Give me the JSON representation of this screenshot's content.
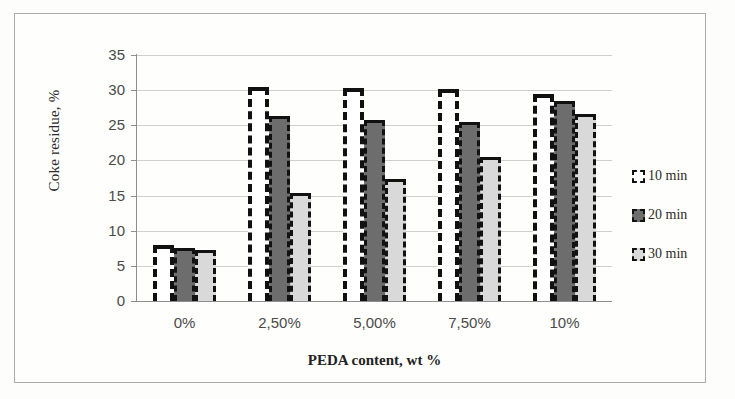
{
  "chart_data": {
    "type": "bar",
    "title": "",
    "xlabel": "PEDA content, wt %",
    "ylabel": "Coke residue, %",
    "categories": [
      "0%",
      "2,50%",
      "5,00%",
      "7,50%",
      "10%"
    ],
    "series": [
      {
        "name": "10 min",
        "values": [
          8.0,
          30.5,
          30.3,
          30.1,
          29.5
        ],
        "color": "#ffffff"
      },
      {
        "name": "20 min",
        "values": [
          7.5,
          26.3,
          25.7,
          25.4,
          28.4
        ],
        "color": "#6d6d6d"
      },
      {
        "name": "30 min",
        "values": [
          7.2,
          15.3,
          17.3,
          20.5,
          26.6
        ],
        "color": "#d9d9d9"
      }
    ],
    "ylim": [
      0,
      35
    ],
    "ytick_values": [
      0,
      5,
      10,
      15,
      20,
      25,
      30,
      35
    ],
    "ytick_labels": [
      "0",
      "5",
      "10",
      "15",
      "20",
      "25",
      "30",
      "35"
    ],
    "grid": true,
    "legend_position": "right"
  },
  "legend": {
    "items": [
      {
        "label": "10 min"
      },
      {
        "label": "20 min"
      },
      {
        "label": "30 min"
      }
    ]
  }
}
